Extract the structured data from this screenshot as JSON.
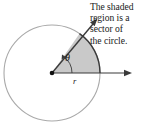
{
  "figure": {
    "title": "",
    "caption": {
      "lines": [
        "The shaded",
        "region is a",
        "sector of",
        "the circle."
      ],
      "full_text": "The shaded region is a sector of the circle."
    },
    "labels": {
      "angle": "θ",
      "radius": "r"
    },
    "colors": {
      "circle_stroke": "#a9a9a9",
      "sector_fill": "#c9c9c9",
      "sector_stroke": "#3a3a3a",
      "ray_stroke": "#3a3a3a",
      "arc_marker_stroke": "#3a3a3a",
      "text": "#1a1a1a",
      "background": "#ffffff"
    },
    "geometry": {
      "circle_center_x": 52,
      "circle_center_y": 73,
      "circle_radius": 48,
      "sector_start_angle_deg": 0,
      "sector_end_angle_deg": 55,
      "angle_marker_radius": 20,
      "horizontal_ray_length": 78,
      "diagonal_ray_length": 66,
      "center_dot_radius": 2.2
    },
    "elements": {
      "circle_name": "circle outline",
      "sector_name": "shaded sector",
      "horizontal_ray_name": "initial side ray",
      "diagonal_ray_name": "terminal side ray",
      "center_name": "circle center vertex"
    }
  }
}
